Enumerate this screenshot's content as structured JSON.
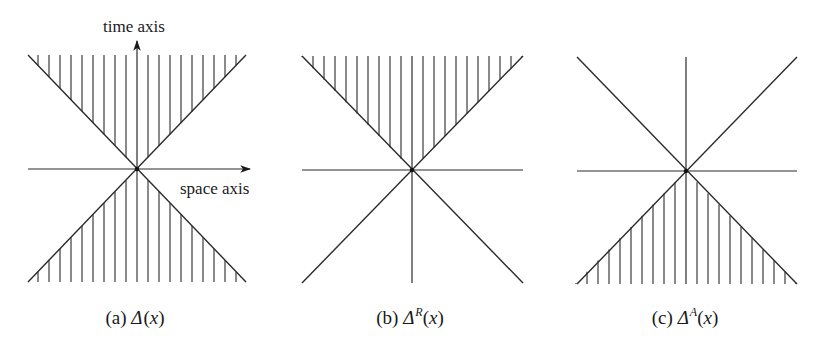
{
  "figure": {
    "width": 823,
    "height": 344,
    "line_color": "#2a2a2a",
    "hatch_spacing": 11,
    "labels": {
      "time_axis": "time axis",
      "space_axis": "space axis"
    },
    "panels": [
      {
        "id": "a",
        "cx": 137,
        "cy": 169,
        "left": 28,
        "right": 246,
        "top": 55,
        "bottom": 282,
        "hatch_upper": true,
        "hatch_lower": true,
        "time_arrow": true,
        "space_arrow": true,
        "vertical_line_full": false,
        "caption": {
          "prefix": "(a) ",
          "symbol": "Δ",
          "superscript": "",
          "open": "(",
          "arg": "x",
          "close": ")",
          "x": 135,
          "y": 308
        }
      },
      {
        "id": "b",
        "cx": 412,
        "cy": 170,
        "left": 302,
        "right": 523,
        "top": 56,
        "bottom": 283,
        "hatch_upper": true,
        "hatch_lower": false,
        "time_arrow": false,
        "space_arrow": false,
        "vertical_line_full": true,
        "caption": {
          "prefix": "(b) ",
          "symbol": "Δ",
          "superscript": "R",
          "open": "(",
          "arg": "x",
          "close": ")",
          "x": 410,
          "y": 308
        }
      },
      {
        "id": "c",
        "cx": 686,
        "cy": 171,
        "left": 577,
        "right": 797,
        "top": 57,
        "bottom": 284,
        "hatch_upper": false,
        "hatch_lower": true,
        "time_arrow": false,
        "space_arrow": false,
        "vertical_line_full": true,
        "caption": {
          "prefix": "(c) ",
          "symbol": "Δ",
          "superscript": "A",
          "open": "(",
          "arg": "x",
          "close": ")",
          "x": 685,
          "y": 308
        }
      }
    ]
  }
}
